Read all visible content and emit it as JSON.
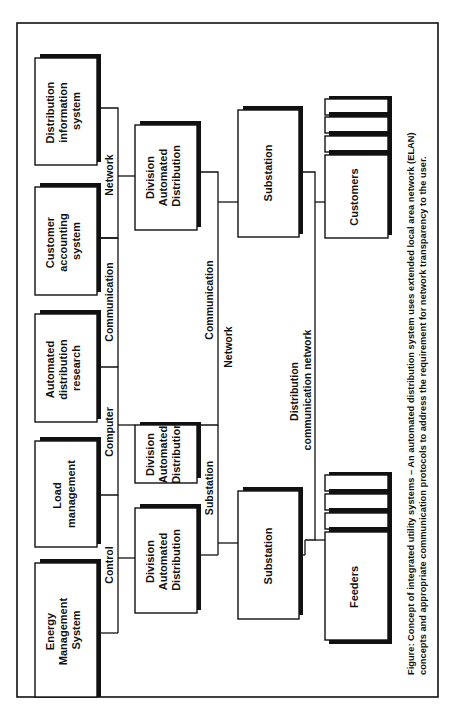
{
  "figure": {
    "caption_line1": "Figure: Concept of integrated utility systems – An automated distribution system uses extended local area network (ELAN)",
    "caption_line2": "concepts and appropriate communication protocols to address the requirement for network transparency to the user.",
    "orientation": "rotated 90° counter-clockwise"
  },
  "top_systems": [
    {
      "lines": [
        "Distribution",
        "information",
        "system"
      ]
    },
    {
      "lines": [
        "Customer",
        "accounting",
        "system"
      ]
    },
    {
      "lines": [
        "Automated",
        "distribution",
        "research"
      ]
    },
    {
      "lines": [
        "Load",
        "management"
      ]
    },
    {
      "lines": [
        "Energy",
        "Management",
        "System"
      ]
    }
  ],
  "control_bus": {
    "labels": [
      "Network",
      "Communication",
      "Computer",
      "Control"
    ]
  },
  "division_nodes": [
    {
      "lines": [
        "Division",
        "Automated",
        "Distribution"
      ]
    },
    {
      "lines": [
        "Division",
        "Automated",
        "Distribution"
      ]
    },
    {
      "lines": [
        "Division",
        "Automated",
        "Distribution"
      ]
    }
  ],
  "substation_bus": {
    "labels": [
      "Communication",
      "Network",
      "Substation"
    ]
  },
  "substations": [
    {
      "label": "Substation"
    },
    {
      "label": "Substation"
    }
  ],
  "distribution_bus": {
    "lines": [
      "Distribution",
      "communication network"
    ]
  },
  "endpoints": [
    {
      "label": "Customers"
    },
    {
      "label": "Feeders"
    }
  ]
}
